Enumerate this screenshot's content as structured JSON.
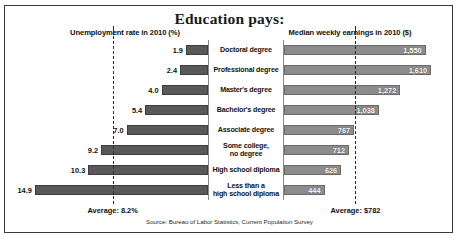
{
  "title": "Education pays:",
  "headers": {
    "left": "Unemployment rate in 2010 (%)",
    "right": "Median weekly earnings in 2010 ($)"
  },
  "averages": {
    "left_label": "Average: 8.2%",
    "right_label": "Average: $782",
    "left_value": 8.2,
    "right_value": 782
  },
  "source": "Source: Bureau of Labor Statistics, Current Population Survey",
  "rows": [
    {
      "category": "Doctoral degree",
      "unemployment": "1.9",
      "earnings": "1,550"
    },
    {
      "category": "Professional degree",
      "unemployment": "2.4",
      "earnings": "1,610"
    },
    {
      "category": "Master's degree",
      "unemployment": "4.0",
      "earnings": "1,272"
    },
    {
      "category": "Bachelor's degree",
      "unemployment": "5.4",
      "earnings": "1,038"
    },
    {
      "category": "Associate degree",
      "unemployment": "7.0",
      "earnings": "767"
    },
    {
      "category": "Some college,\nno degree",
      "unemployment": "9.2",
      "earnings": "712"
    },
    {
      "category": "High school diploma",
      "unemployment": "10.3",
      "earnings": "626"
    },
    {
      "category": "Less than a\nhigh school diploma",
      "unemployment": "14.9",
      "earnings": "444"
    }
  ],
  "chart_data": {
    "type": "bar",
    "title": "Education pays:",
    "orientation": "horizontal",
    "layout": "back-to-back dual panel, shared center category column",
    "grid": false,
    "legend": null,
    "categories": [
      "Doctoral degree",
      "Professional degree",
      "Master's degree",
      "Bachelor's degree",
      "Associate degree",
      "Some college, no degree",
      "High school diploma",
      "Less than a high school diploma"
    ],
    "series": [
      {
        "name": "Unemployment rate in 2010 (%)",
        "panel": "left",
        "direction": "right-to-left",
        "unit": "%",
        "values": [
          1.9,
          2.4,
          4.0,
          5.4,
          7.0,
          9.2,
          10.3,
          14.9
        ],
        "xlim": [
          0,
          16
        ],
        "reference_line": {
          "label": "Average: 8.2%",
          "value": 8.2
        }
      },
      {
        "name": "Median weekly earnings in 2010 ($)",
        "panel": "right",
        "direction": "left-to-right",
        "unit": "$",
        "values": [
          1550,
          1610,
          1272,
          1038,
          767,
          712,
          626,
          444
        ],
        "xlim": [
          0,
          1750
        ],
        "reference_line": {
          "label": "Average: $782",
          "value": 782
        }
      }
    ],
    "annotations": [
      "Source: Bureau of Labor Statistics, Current Population Survey"
    ],
    "colors": {
      "left_bar": "#595959",
      "right_bar": "#8c8c8c",
      "reference_line": "#2b2b2b"
    }
  }
}
